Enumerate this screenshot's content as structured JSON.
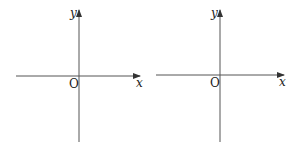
{
  "diagrams": [
    {
      "name": "left-coordinate-system",
      "x_label": "x",
      "y_label": "y",
      "origin_label": "O",
      "axis_color": "#444444"
    },
    {
      "name": "right-coordinate-system",
      "x_label": "x",
      "y_label": "y",
      "origin_label": "O",
      "axis_color": "#444444"
    }
  ]
}
